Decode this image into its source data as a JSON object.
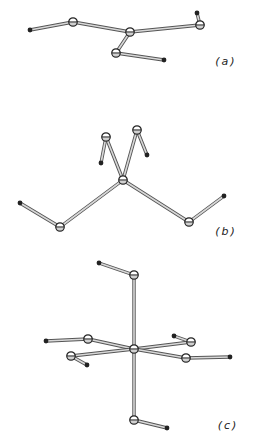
{
  "figure": {
    "background": "#ffffff",
    "bond_color": "#9a9a9a",
    "bond_edge_color": "#555555",
    "atom_color": "#222222",
    "panels": [
      {
        "id": "a",
        "label": "(a)",
        "label_pos": [
          226,
          65
        ],
        "ring_atoms": [
          [
            73,
            22
          ],
          [
            130,
            32
          ],
          [
            200,
            25
          ],
          [
            116,
            53
          ]
        ],
        "small_atoms": [
          [
            30,
            30
          ],
          [
            197,
            13
          ],
          [
            164,
            60
          ]
        ],
        "bonds": [
          [
            [
              30,
              30
            ],
            [
              73,
              22
            ]
          ],
          [
            [
              73,
              22
            ],
            [
              130,
              32
            ]
          ],
          [
            [
              130,
              32
            ],
            [
              200,
              25
            ]
          ],
          [
            [
              200,
              25
            ],
            [
              197,
              13
            ]
          ],
          [
            [
              130,
              32
            ],
            [
              116,
              53
            ]
          ],
          [
            [
              116,
              53
            ],
            [
              164,
              60
            ]
          ]
        ]
      },
      {
        "id": "b",
        "label": "(b)",
        "label_pos": [
          226,
          235
        ],
        "ring_atoms": [
          [
            106,
            137
          ],
          [
            137,
            130
          ],
          [
            123,
            180
          ],
          [
            60,
            227
          ],
          [
            189,
            222
          ]
        ],
        "small_atoms": [
          [
            101,
            163
          ],
          [
            147,
            155
          ],
          [
            20,
            203
          ],
          [
            224,
            196
          ]
        ],
        "bonds": [
          [
            [
              123,
              180
            ],
            [
              106,
              137
            ]
          ],
          [
            [
              106,
              137
            ],
            [
              101,
              163
            ]
          ],
          [
            [
              123,
              180
            ],
            [
              137,
              130
            ]
          ],
          [
            [
              137,
              130
            ],
            [
              147,
              155
            ]
          ],
          [
            [
              123,
              180
            ],
            [
              60,
              227
            ]
          ],
          [
            [
              60,
              227
            ],
            [
              20,
              203
            ]
          ],
          [
            [
              123,
              180
            ],
            [
              189,
              222
            ]
          ],
          [
            [
              189,
              222
            ],
            [
              224,
              196
            ]
          ]
        ]
      },
      {
        "id": "c",
        "label": "(c)",
        "label_pos": [
          228,
          429
        ],
        "ring_atoms": [
          [
            134,
            275
          ],
          [
            134,
            349
          ],
          [
            88,
            339
          ],
          [
            71,
            356
          ],
          [
            191,
            342
          ],
          [
            186,
            358
          ],
          [
            134,
            420
          ]
        ],
        "small_atoms": [
          [
            99,
            263
          ],
          [
            46,
            341
          ],
          [
            87,
            365
          ],
          [
            174,
            336
          ],
          [
            230,
            357
          ],
          [
            167,
            428
          ]
        ],
        "bonds": [
          [
            [
              99,
              263
            ],
            [
              134,
              275
            ]
          ],
          [
            [
              134,
              275
            ],
            [
              134,
              349
            ]
          ],
          [
            [
              134,
              349
            ],
            [
              134,
              420
            ]
          ],
          [
            [
              134,
              420
            ],
            [
              167,
              428
            ]
          ],
          [
            [
              134,
              349
            ],
            [
              88,
              339
            ]
          ],
          [
            [
              88,
              339
            ],
            [
              46,
              341
            ]
          ],
          [
            [
              134,
              349
            ],
            [
              71,
              356
            ]
          ],
          [
            [
              71,
              356
            ],
            [
              87,
              365
            ]
          ],
          [
            [
              134,
              349
            ],
            [
              191,
              342
            ]
          ],
          [
            [
              191,
              342
            ],
            [
              174,
              336
            ]
          ],
          [
            [
              134,
              349
            ],
            [
              186,
              358
            ]
          ],
          [
            [
              186,
              358
            ],
            [
              230,
              357
            ]
          ]
        ]
      }
    ]
  }
}
